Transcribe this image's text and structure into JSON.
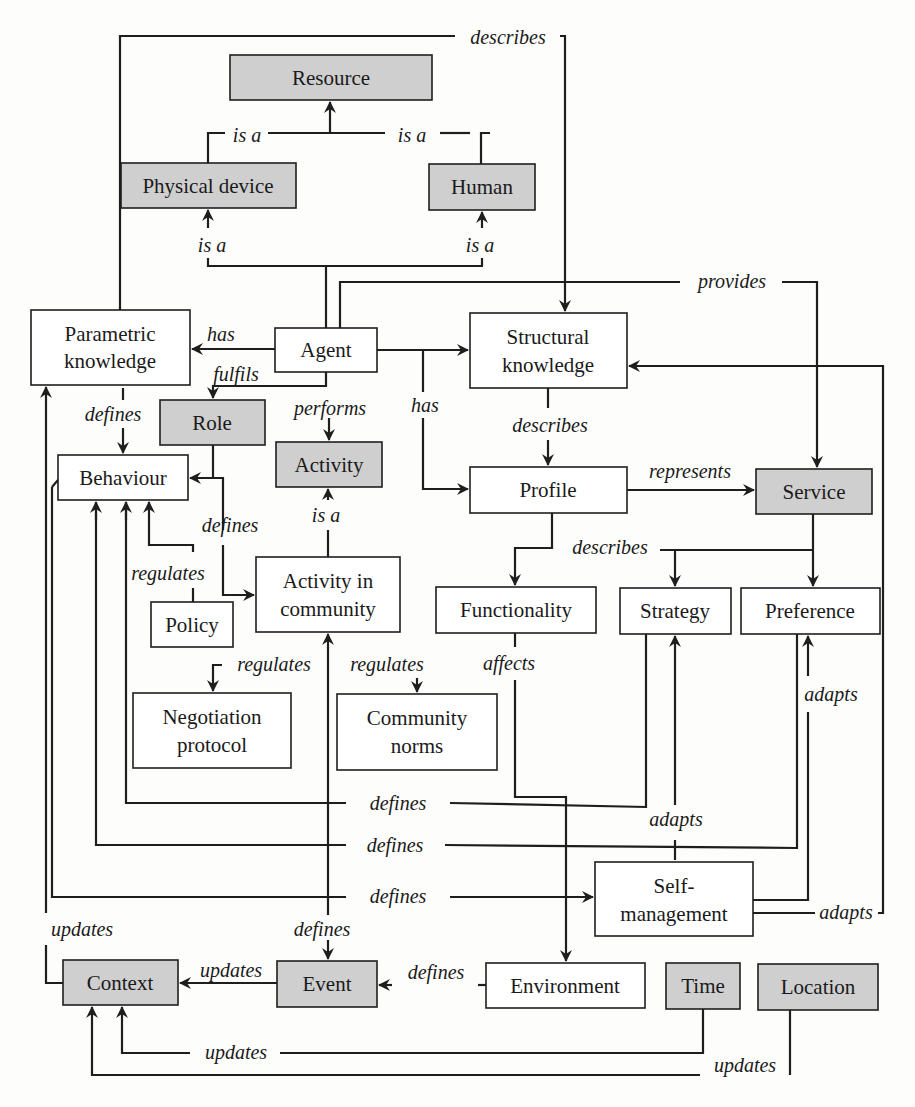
{
  "diagram": {
    "nodes": {
      "resource": {
        "label": "Resource",
        "style": "gray"
      },
      "physical_device": {
        "label": "Physical device",
        "style": "gray"
      },
      "human": {
        "label": "Human",
        "style": "gray"
      },
      "parametric_knowledge": {
        "label1": "Parametric",
        "label2": "knowledge",
        "style": "white"
      },
      "agent": {
        "label": "Agent",
        "style": "white"
      },
      "structural_knowledge": {
        "label1": "Structural",
        "label2": "knowledge",
        "style": "white"
      },
      "role": {
        "label": "Role",
        "style": "gray"
      },
      "activity": {
        "label": "Activity",
        "style": "gray"
      },
      "behaviour": {
        "label": "Behaviour",
        "style": "white"
      },
      "profile": {
        "label": "Profile",
        "style": "white"
      },
      "service": {
        "label": "Service",
        "style": "gray"
      },
      "activity_in_community": {
        "label1": "Activity in",
        "label2": "community",
        "style": "white"
      },
      "policy": {
        "label": "Policy",
        "style": "white"
      },
      "functionality": {
        "label": "Functionality",
        "style": "white"
      },
      "strategy": {
        "label": "Strategy",
        "style": "white"
      },
      "preference": {
        "label": "Preference",
        "style": "white"
      },
      "negotiation_protocol": {
        "label1": "Negotiation",
        "label2": "protocol",
        "style": "white"
      },
      "community_norms": {
        "label1": "Community",
        "label2": "norms",
        "style": "white"
      },
      "self_management": {
        "label1": "Self-",
        "label2": "management",
        "style": "white"
      },
      "context": {
        "label": "Context",
        "style": "gray"
      },
      "event": {
        "label": "Event",
        "style": "gray"
      },
      "environment": {
        "label": "Environment",
        "style": "white"
      },
      "time": {
        "label": "Time",
        "style": "gray"
      },
      "location": {
        "label": "Location",
        "style": "gray"
      }
    },
    "edge_labels": {
      "parametric_describes_structural": "describes",
      "physical_isa_resource": "is a",
      "human_isa_resource": "is a",
      "agent_isa_physical": "is a",
      "agent_isa_human": "is a",
      "agent_provides_service": "provides",
      "agent_has_parametric": "has",
      "agent_fulfils_role": "fulfils",
      "agent_performs_activity": "performs",
      "agent_has_profile": "has",
      "parametric_defines_behaviour": "defines",
      "structural_describes_profile": "describes",
      "profile_represents_service": "represents",
      "role_defines": "defines",
      "aic_isa_activity": "is a",
      "policy_regulates_behaviour": "regulates",
      "profile_describes": "describes",
      "functionality_affects_environment": "affects",
      "aic_regulates_negotiation": "regulates",
      "aic_regulates_norms": "regulates",
      "preference_adapts": "adapts",
      "self_defines_1": "defines",
      "self_defines_2": "defines",
      "self_defines_3": "defines",
      "self_adapts_strategy": "adapts",
      "self_adapts_structural": "adapts",
      "parametric_updates": "updates",
      "event_defines_aic": "defines",
      "event_updates_context": "updates",
      "environment_defines_event": "defines",
      "time_updates_context": "updates",
      "location_updates_context": "updates"
    }
  }
}
